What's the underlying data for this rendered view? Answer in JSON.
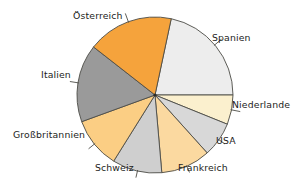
{
  "chart_data": {
    "type": "pie",
    "title": "",
    "subtitle": "",
    "xlabel": "",
    "ylabel": "",
    "grid": false,
    "legend_position": "none",
    "labels_position": "outside",
    "center": {
      "x": 155,
      "y": 95
    },
    "radius": 78,
    "start_angle_deg": -78,
    "direction": "clockwise",
    "categories": [
      "Spanien",
      "Niederlande",
      "USA",
      "Frankreich",
      "Schweiz",
      "Großbritannien",
      "Italien",
      "Österreich"
    ],
    "values": [
      21.7,
      6.1,
      7.2,
      10.3,
      10.3,
      10.6,
      16.1,
      17.7
    ],
    "unit": "%",
    "colors": [
      "#ededed",
      "#fbf0ce",
      "#d8d8d8",
      "#fbd9a0",
      "#cfcfcf",
      "#fbce84",
      "#9a9a9a",
      "#f5a33c"
    ],
    "slices": [
      {
        "label": "Spanien",
        "value": 21.7,
        "color": "#ededed",
        "start_deg": -78,
        "end_deg": 0
      },
      {
        "label": "Niederlande",
        "value": 6.1,
        "color": "#fbf0ce",
        "start_deg": 0,
        "end_deg": 22
      },
      {
        "label": "USA",
        "value": 7.2,
        "color": "#d8d8d8",
        "start_deg": 22,
        "end_deg": 48
      },
      {
        "label": "Frankreich",
        "value": 10.3,
        "color": "#fbd9a0",
        "start_deg": 48,
        "end_deg": 85
      },
      {
        "label": "Schweiz",
        "value": 10.3,
        "color": "#cfcfcf",
        "start_deg": 85,
        "end_deg": 122
      },
      {
        "label": "Großbritannien",
        "value": 10.6,
        "color": "#fbce84",
        "start_deg": 122,
        "end_deg": 160
      },
      {
        "label": "Italien",
        "value": 16.1,
        "color": "#9a9a9a",
        "start_deg": 160,
        "end_deg": 218
      },
      {
        "label": "Österreich",
        "value": 17.7,
        "color": "#f5a33c",
        "start_deg": 218,
        "end_deg": 282
      }
    ],
    "outline_color": "#4c4c46",
    "background_color": "#ffffff"
  },
  "labels": {
    "oesterreich": "Österreich",
    "spanien": "Spanien",
    "niederlande": "Niederlande",
    "usa": "USA",
    "frankreich": "Frankreich",
    "schweiz": "Schweiz",
    "grossbritannien": "Großbritannien",
    "italien": "Italien"
  }
}
